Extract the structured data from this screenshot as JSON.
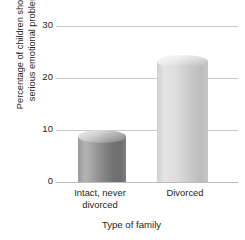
{
  "chart_data": {
    "type": "bar",
    "title": "",
    "subtitle": "",
    "categories": [
      "Intact, never divorced",
      "Divorced"
    ],
    "values": [
      10,
      24.5
    ],
    "xlabel": "Type of family",
    "ylabel": "Percentage of children showing serious emotional problems",
    "ylim": [
      0,
      30
    ],
    "yticks": [
      0,
      10,
      20,
      30
    ],
    "ytick_labels": [
      "0",
      "10",
      "20",
      "30"
    ],
    "grid": true,
    "legend": "none",
    "series": [
      {
        "name": "Percentage of children showing serious emotional problems",
        "values": [
          10,
          24.5
        ]
      }
    ],
    "bar_style": "3d-cylinder",
    "bar_colors": [
      "#8e8e8e",
      "#d8d8d8"
    ],
    "gridline_color": "#c9c9c9",
    "background_color": "#ffffff",
    "text_color": "#231f20"
  },
  "axis": {
    "y_title_line1": "Percentage of children showing",
    "y_title_line2": "serious emotional problems",
    "x_title": "Type of family"
  },
  "yticks": [
    {
      "label": "30",
      "value": 30
    },
    {
      "label": "20",
      "value": 20
    },
    {
      "label": "10",
      "value": 10
    },
    {
      "label": "0",
      "value": 0
    }
  ],
  "xticks": [
    {
      "line1": "Intact, never",
      "line2": "divorced"
    },
    {
      "line1": "Divorced",
      "line2": ""
    }
  ],
  "bars": [
    {
      "label": "Intact, never divorced",
      "value": 10
    },
    {
      "label": "Divorced",
      "value": 24.5
    }
  ]
}
